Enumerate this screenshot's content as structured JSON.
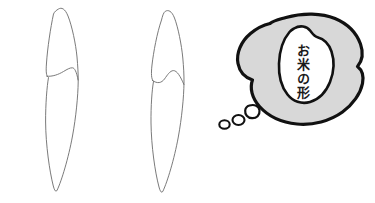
{
  "figure": {
    "background_color": "#ffffff",
    "outline_color": "#666666",
    "bubble_outline_color": "#111111",
    "bubble_fill_color": "#d8d8d8",
    "inner_shape_fill_color": "#ffffff"
  },
  "shapes": {
    "left_grain": {
      "name": "Outlined grain shape, left",
      "caption": ""
    },
    "middle_grain": {
      "name": "Outlined grain shape, middle",
      "caption": ""
    }
  },
  "thought_bubble": {
    "text": "お米の形",
    "text_lines": [
      "お",
      "米",
      "の",
      "形"
    ],
    "reading": "okome no katachi",
    "trail_bubble_count": 3
  }
}
